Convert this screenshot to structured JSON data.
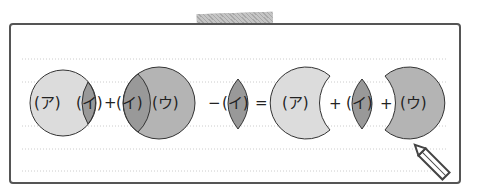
{
  "diagram": {
    "equation_left": [
      {
        "shape": "circle-with-lens-right",
        "labels": [
          "(ア)",
          "(イ)"
        ]
      },
      {
        "operator": "+"
      },
      {
        "shape": "circle-with-lens-left",
        "labels": [
          "(イ)",
          "(ウ)"
        ]
      },
      {
        "operator": "−"
      },
      {
        "shape": "lens",
        "labels": [
          "(イ)"
        ]
      }
    ],
    "equals": "=",
    "equation_right": [
      {
        "shape": "crescent-left",
        "labels": [
          "(ア)"
        ]
      },
      {
        "operator": "+"
      },
      {
        "shape": "lens",
        "labels": [
          "(イ)"
        ]
      },
      {
        "operator": "+"
      },
      {
        "shape": "crescent-right",
        "labels": [
          "(ウ)"
        ]
      }
    ],
    "labels": {
      "a": "(ア)",
      "i": "(イ)",
      "u": "(ウ)",
      "plus": "+",
      "minus": "−",
      "eq": "="
    },
    "colors": {
      "light": "#dcdcdc",
      "mid": "#b4b4b4",
      "dark": "#999999",
      "stroke": "#333333"
    }
  }
}
